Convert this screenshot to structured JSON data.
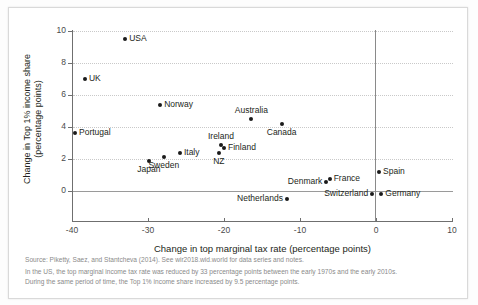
{
  "chart_data": {
    "type": "scatter",
    "title": "",
    "xlabel": "Change in top marginal tax rate (percentage points)",
    "ylabel_line1": "Change in Top 1% income share",
    "ylabel_line2": "(percentage points)",
    "xlim": [
      -40,
      10
    ],
    "ylim": [
      0,
      10
    ],
    "xticks": [
      -40,
      -30,
      -20,
      -10,
      0,
      10
    ],
    "xtick_labels": [
      "-40",
      "-30",
      "-20",
      "-10",
      "0",
      "10"
    ],
    "yticks": [
      0,
      2,
      4,
      6,
      8,
      10
    ],
    "ytick_labels": [
      "0",
      "2",
      "4",
      "6",
      "8",
      "10"
    ],
    "grid": "horizontal dotted gridlines at each y tick; solid reference lines at x=0 and y=0",
    "legend": "none",
    "points": [
      {
        "label": "USA",
        "x": -33.0,
        "y": 9.5,
        "label_pos": "right"
      },
      {
        "label": "UK",
        "x": -38.3,
        "y": 7.0,
        "label_pos": "right"
      },
      {
        "label": "Norway",
        "x": -28.4,
        "y": 5.4,
        "label_pos": "right"
      },
      {
        "label": "Portugal",
        "x": -39.6,
        "y": 3.6,
        "label_pos": "right"
      },
      {
        "label": "Australia",
        "x": -16.4,
        "y": 4.5,
        "label_pos": "above"
      },
      {
        "label": "Canada",
        "x": -12.4,
        "y": 4.2,
        "label_pos": "below"
      },
      {
        "label": "Ireland",
        "x": -20.4,
        "y": 2.9,
        "label_pos": "above"
      },
      {
        "label": "Finland",
        "x": -20.0,
        "y": 2.7,
        "label_pos": "right"
      },
      {
        "label": "NZ",
        "x": -20.7,
        "y": 2.4,
        "label_pos": "below"
      },
      {
        "label": "Italy",
        "x": -25.8,
        "y": 2.4,
        "label_pos": "right"
      },
      {
        "label": "Sweden",
        "x": -27.9,
        "y": 2.1,
        "label_pos": "below"
      },
      {
        "label": "Japan",
        "x": -29.9,
        "y": 1.9,
        "label_pos": "below"
      },
      {
        "label": "France",
        "x": -6.1,
        "y": 0.75,
        "label_pos": "right"
      },
      {
        "label": "Denmark",
        "x": -6.6,
        "y": 0.55,
        "label_pos": "left"
      },
      {
        "label": "Spain",
        "x": 0.4,
        "y": 1.2,
        "label_pos": "right"
      },
      {
        "label": "Germany",
        "x": 0.7,
        "y": -0.2,
        "label_pos": "right"
      },
      {
        "label": "Switzerland",
        "x": -0.5,
        "y": -0.2,
        "label_pos": "left"
      },
      {
        "label": "Netherlands",
        "x": -11.7,
        "y": -0.5,
        "label_pos": "left"
      }
    ]
  },
  "notes": {
    "source": "Source: Piketty, Saez, and Stantcheva (2014). See wir2018.wid.world for data series and notes.",
    "note_line1": "In the US, the top marginal income tax rate was reduced by 33 percentage points between the early 1970s and the early 2010s.",
    "note_line2": "During the same period of time, the Top 1% income share increased by 9.5 percentage points."
  }
}
